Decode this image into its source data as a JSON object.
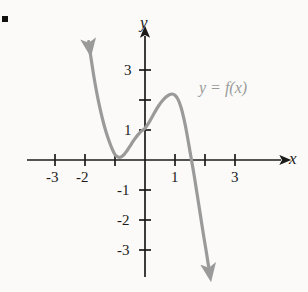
{
  "figure": {
    "bullet_marker": "■",
    "background_color": "#fbfaf8",
    "axis_color": "#1b1b1b",
    "curve_color": "#9a9a9a",
    "label_color": "#1b1b1b"
  },
  "axes": {
    "x_axis_label": "x",
    "y_axis_label": "y",
    "x_tick_labels": [
      "-3",
      "-2",
      "1",
      "3"
    ],
    "y_tick_labels": [
      "3",
      "1",
      "-1",
      "-2",
      "-3"
    ]
  },
  "annotations": {
    "curve_label": "y = f(x)"
  },
  "chart_data": {
    "type": "line",
    "title": "",
    "xlabel": "x",
    "ylabel": "y",
    "xlim": [
      -3.9,
      4.2
    ],
    "ylim": [
      -3.9,
      4.2
    ],
    "grid": false,
    "legend": "none",
    "x_ticks": [
      -3,
      -2,
      -1,
      1,
      2,
      3
    ],
    "x_ticks_labeled": [
      -3,
      -2,
      1,
      3
    ],
    "y_ticks": [
      -3,
      -2,
      -1,
      1,
      2,
      3
    ],
    "y_ticks_labeled": [
      -3,
      -2,
      -1,
      1,
      3
    ],
    "annotations": [
      {
        "text": "y = f(x)",
        "x": 2.05,
        "y": 2.75,
        "color": "#9a9a9a"
      }
    ],
    "series": [
      {
        "name": "y = f(x)",
        "color": "#9a9a9a",
        "arrow_start": true,
        "arrow_end": true,
        "features": {
          "double_root_x": -1,
          "simple_root_x": 1.55,
          "y_intercept": 1.05,
          "local_min": {
            "x": -1,
            "y": 0
          },
          "local_max": {
            "x": 0.9,
            "y": 2.2
          }
        },
        "points": [
          {
            "x": -1.88,
            "y": 3.95
          },
          {
            "x": -1.8,
            "y": 3.4
          },
          {
            "x": -1.7,
            "y": 2.76
          },
          {
            "x": -1.6,
            "y": 2.2
          },
          {
            "x": -1.5,
            "y": 1.72
          },
          {
            "x": -1.4,
            "y": 1.3
          },
          {
            "x": -1.3,
            "y": 0.94
          },
          {
            "x": -1.2,
            "y": 0.64
          },
          {
            "x": -1.1,
            "y": 0.38
          },
          {
            "x": -1.0,
            "y": 0.18
          },
          {
            "x": -0.9,
            "y": 0.1
          },
          {
            "x": -0.8,
            "y": 0.1
          },
          {
            "x": -0.7,
            "y": 0.18
          },
          {
            "x": -0.6,
            "y": 0.31
          },
          {
            "x": -0.5,
            "y": 0.46
          },
          {
            "x": -0.4,
            "y": 0.62
          },
          {
            "x": -0.3,
            "y": 0.76
          },
          {
            "x": -0.2,
            "y": 0.88
          },
          {
            "x": -0.1,
            "y": 0.98
          },
          {
            "x": 0.0,
            "y": 1.06
          },
          {
            "x": 0.15,
            "y": 1.28
          },
          {
            "x": 0.3,
            "y": 1.55
          },
          {
            "x": 0.45,
            "y": 1.8
          },
          {
            "x": 0.6,
            "y": 2.0
          },
          {
            "x": 0.75,
            "y": 2.14
          },
          {
            "x": 0.9,
            "y": 2.2
          },
          {
            "x": 1.0,
            "y": 2.16
          },
          {
            "x": 1.1,
            "y": 2.02
          },
          {
            "x": 1.2,
            "y": 1.76
          },
          {
            "x": 1.3,
            "y": 1.36
          },
          {
            "x": 1.4,
            "y": 0.86
          },
          {
            "x": 1.5,
            "y": 0.28
          },
          {
            "x": 1.55,
            "y": 0.0
          },
          {
            "x": 1.65,
            "y": -0.58
          },
          {
            "x": 1.75,
            "y": -1.22
          },
          {
            "x": 1.85,
            "y": -1.86
          },
          {
            "x": 1.95,
            "y": -2.5
          },
          {
            "x": 2.05,
            "y": -3.1
          },
          {
            "x": 2.12,
            "y": -3.55
          }
        ]
      }
    ]
  }
}
